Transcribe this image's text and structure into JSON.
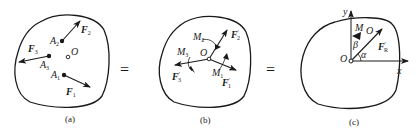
{
  "figure": {
    "panels": [
      {
        "id": "a",
        "caption": "(a)",
        "labels": {
          "O": "O",
          "A1": "A",
          "A1_sub": "1",
          "A2": "A",
          "A2_sub": "2",
          "A3": "A",
          "A3_sub": "3",
          "F1": "F",
          "F1_sub": "1",
          "F2": "F",
          "F2_sub": "2",
          "F3": "F",
          "F3_sub": "3"
        }
      },
      {
        "id": "b",
        "caption": "(b)",
        "labels": {
          "O": "O",
          "M1": "M",
          "M1_sub": "1",
          "M2": "M",
          "M2_sub": "2",
          "M3": "M",
          "M3_sub": "3",
          "F1p": "F",
          "F1p_sub": "1",
          "F1p_prime": "′",
          "F2p": "F",
          "F2p_sub": "2",
          "F2p_prime": "′",
          "F3p": "F",
          "F3p_sub": "3",
          "F3p_prime": "′"
        }
      },
      {
        "id": "c",
        "caption": "(c)",
        "labels": {
          "O": "O",
          "O_top": "O",
          "M": "M",
          "FR": "F",
          "FR_sub": "R",
          "FR_prime": "′",
          "x": "x",
          "y": "y",
          "alpha": "α",
          "beta": "β"
        }
      }
    ],
    "equals": [
      "=",
      "="
    ],
    "colors": {
      "stroke": "#1a1a1a",
      "background": "#ffffff"
    }
  }
}
